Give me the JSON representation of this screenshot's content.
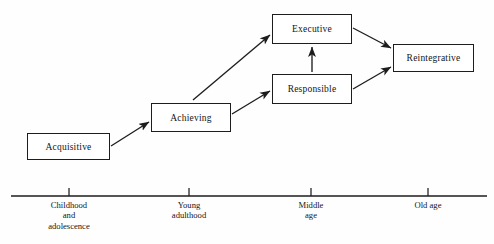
{
  "diagram": {
    "background_color": "#fefefe",
    "line_color": "#1d1d1d",
    "text_color": "#141414",
    "stages": [
      {
        "id": "acquisitive",
        "label": "Acquisitive",
        "x": 27,
        "y": 133,
        "width": 83,
        "height": 27
      },
      {
        "id": "achieving",
        "label": "Achieving",
        "x": 151,
        "y": 103,
        "width": 80,
        "height": 29
      },
      {
        "id": "executive",
        "label": "Executive",
        "x": 272,
        "y": 14,
        "width": 80,
        "height": 30
      },
      {
        "id": "responsible",
        "label": "Responsible",
        "x": 272,
        "y": 74,
        "width": 80,
        "height": 30
      },
      {
        "id": "reintegrative",
        "label": "Reintegrative",
        "x": 393,
        "y": 44,
        "width": 81,
        "height": 28
      }
    ],
    "arrows": [
      {
        "id": "acquisitive-to-achieving",
        "x1": 111,
        "y1": 146,
        "x2": 149,
        "y2": 122
      },
      {
        "id": "achieving-to-executive",
        "x1": 193,
        "y1": 100,
        "x2": 270,
        "y2": 35
      },
      {
        "id": "achieving-to-responsible",
        "x1": 232,
        "y1": 114,
        "x2": 270,
        "y2": 91
      },
      {
        "id": "responsible-to-executive",
        "x1": 312,
        "y1": 72,
        "x2": 312,
        "y2": 47
      },
      {
        "id": "executive-to-reintegrative",
        "x1": 353,
        "y1": 28,
        "x2": 391,
        "y2": 48
      },
      {
        "id": "responsible-to-reintegrative",
        "x1": 353,
        "y1": 89,
        "x2": 391,
        "y2": 67
      }
    ],
    "axis": {
      "id": "life-span-axis",
      "x_start": 11,
      "x_end": 487,
      "y": 196,
      "tick_height": 8,
      "ticks": [
        {
          "id": "childhood-and-adolescence",
          "x": 69,
          "lines": [
            "Childhood",
            "and",
            "adolescence"
          ]
        },
        {
          "id": "young-adulthood",
          "x": 189,
          "lines": [
            "Young",
            "adulthood"
          ]
        },
        {
          "id": "middle-age",
          "x": 311,
          "lines": [
            "Middle",
            "age"
          ]
        },
        {
          "id": "old-age",
          "x": 428,
          "lines": [
            "Old age"
          ]
        }
      ]
    }
  }
}
